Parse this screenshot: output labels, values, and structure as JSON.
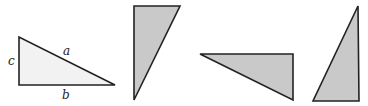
{
  "figure": {
    "colors": {
      "stroke": "#222222",
      "fill_first": "#f2f2f2",
      "fill_others": "#c9c9c9"
    },
    "triangles": [
      {
        "id": "triangle-1",
        "points": "19,37 19,85 115,85",
        "labels": {
          "a": "a",
          "b": "b",
          "c": "c"
        }
      },
      {
        "id": "triangle-2",
        "points": "134,6 180,6 134,100"
      },
      {
        "id": "triangle-3",
        "points": "200,54 293,54 293,100"
      },
      {
        "id": "triangle-4",
        "points": "313,101 359,101 358,6"
      }
    ]
  }
}
